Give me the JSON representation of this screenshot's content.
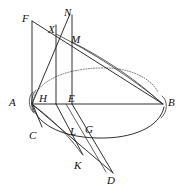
{
  "figure": {
    "background_color": "#ffffff",
    "line_color": "#1a1a1a",
    "dotted_line_color": "#555555",
    "width": 186,
    "height": 193,
    "labels": [
      {
        "id": "F",
        "text": "F",
        "x": 22,
        "y": 13
      },
      {
        "id": "N",
        "text": "N",
        "x": 64,
        "y": 7
      },
      {
        "id": "X",
        "text": "X",
        "x": 48,
        "y": 24
      },
      {
        "id": "M",
        "text": "M",
        "x": 71,
        "y": 34
      },
      {
        "id": "A",
        "text": "A",
        "x": 9,
        "y": 97
      },
      {
        "id": "H",
        "text": "H",
        "x": 39,
        "y": 93
      },
      {
        "id": "E",
        "text": "E",
        "x": 68,
        "y": 93
      },
      {
        "id": "B",
        "text": "B",
        "x": 168,
        "y": 97
      },
      {
        "id": "C",
        "text": "C",
        "x": 29,
        "y": 130
      },
      {
        "id": "L",
        "text": "L",
        "x": 70,
        "y": 126
      },
      {
        "id": "G",
        "text": "G",
        "x": 85,
        "y": 124
      },
      {
        "id": "K",
        "text": "K",
        "x": 74,
        "y": 160
      },
      {
        "id": "D",
        "text": "D",
        "x": 107,
        "y": 175
      }
    ],
    "points": {
      "F": [
        32,
        21
      ],
      "N": [
        72,
        15
      ],
      "X": [
        56,
        34
      ],
      "M": [
        72,
        42
      ],
      "A": [
        32,
        104
      ],
      "H": [
        52,
        104
      ],
      "E": [
        72,
        104
      ],
      "B": [
        163,
        104
      ],
      "C": [
        41,
        124
      ],
      "L": [
        78,
        127
      ],
      "G": [
        86,
        124
      ],
      "K": [
        83,
        155
      ],
      "D": [
        113,
        173
      ]
    },
    "strokes": [
      {
        "name": "baseline-A-B",
        "type": "line",
        "from": "A",
        "to": "B"
      },
      {
        "name": "vertical-F-A",
        "type": "line",
        "from": "F",
        "to": "A"
      },
      {
        "name": "vertical-X-H",
        "type": "line",
        "from": "X",
        "to": "H"
      },
      {
        "name": "vertical-N-E",
        "type": "line",
        "from": "N",
        "to": "E"
      },
      {
        "name": "line-A-N",
        "type": "line",
        "from": "A",
        "to": "N"
      },
      {
        "name": "line-F-B",
        "type": "line",
        "from": "F",
        "to": "B"
      },
      {
        "name": "ellipse-upper-dotted",
        "type": "dotted-arc"
      },
      {
        "name": "ellipse-lower-arc",
        "type": "arc"
      },
      {
        "name": "curve-X-B",
        "type": "curve"
      },
      {
        "name": "curve-M-B",
        "type": "curve"
      },
      {
        "name": "curve-A-left-edge",
        "type": "curve"
      },
      {
        "name": "line-A-C",
        "type": "line",
        "from": "A",
        "to": "C"
      },
      {
        "name": "curve-A-K",
        "type": "curve"
      },
      {
        "name": "line-A-D",
        "type": "line",
        "from": "A",
        "to": "D"
      },
      {
        "name": "line-H-K",
        "type": "line",
        "from": "H",
        "to": "K"
      },
      {
        "name": "line-E-D",
        "type": "line",
        "from": "E",
        "to": "D"
      },
      {
        "name": "line-L-D",
        "type": "line",
        "from": "L",
        "to": "D"
      }
    ]
  }
}
